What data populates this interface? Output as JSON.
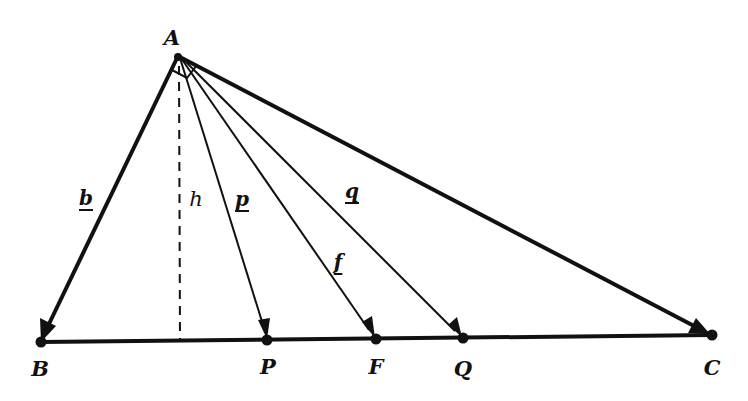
{
  "diagram": {
    "type": "geometry",
    "colors": {
      "stroke": "#111111",
      "background": "#ffffff"
    },
    "points": {
      "A": {
        "label": "A",
        "x": 178,
        "y": 56,
        "label_x": 172,
        "label_y": 37
      },
      "B": {
        "label": "B",
        "x": 41,
        "y": 342,
        "label_x": 40,
        "label_y": 368
      },
      "C": {
        "label": "C",
        "x": 712,
        "y": 335,
        "label_x": 712,
        "label_y": 367
      },
      "P": {
        "label": "P",
        "x": 267,
        "y": 340,
        "label_x": 268,
        "label_y": 366
      },
      "F": {
        "label": "F",
        "x": 376,
        "y": 339,
        "label_x": 376,
        "label_y": 366
      },
      "Q": {
        "label": "Q",
        "x": 463,
        "y": 338,
        "label_x": 463,
        "label_y": 368
      },
      "H": {
        "x": 180,
        "y": 341
      }
    },
    "segments": [
      {
        "name": "vector-b",
        "from": "A",
        "to": "B",
        "label": "b",
        "style": "thick-arrow",
        "label_x": 86,
        "label_y": 198
      },
      {
        "name": "altitude-h",
        "from": "A",
        "to": "H",
        "label": "h",
        "style": "dashed",
        "label_x": 196,
        "label_y": 199
      },
      {
        "name": "vector-p",
        "from": "A",
        "to": "P",
        "label": "p",
        "style": "thin-arrow",
        "label_x": 242,
        "label_y": 199
      },
      {
        "name": "vector-f",
        "from": "A",
        "to": "F",
        "label": "f",
        "style": "thin-arrow",
        "label_x": 338,
        "label_y": 262
      },
      {
        "name": "vector-q",
        "from": "A",
        "to": "Q",
        "label": "q",
        "style": "thin-arrow",
        "label_x": 352,
        "label_y": 191
      },
      {
        "name": "vector-c",
        "from": "A",
        "to": "C",
        "label": "",
        "style": "thick-arrow"
      },
      {
        "name": "base-bc",
        "from": "B",
        "to": "C",
        "label": "",
        "style": "thick-line"
      }
    ],
    "annotations": [
      {
        "name": "right-angle-mark",
        "description": "right angle between p and q at A"
      }
    ]
  }
}
